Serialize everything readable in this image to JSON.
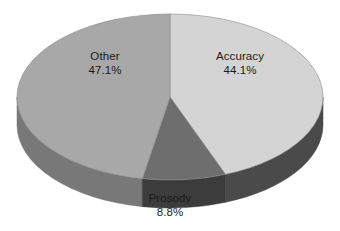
{
  "chart_data": {
    "type": "pie",
    "title": "",
    "subtitle": "",
    "xlabel": "",
    "ylabel": "",
    "grid": false,
    "legend": "none",
    "labels_position": "inside-and-below",
    "three_d": true,
    "background_color": "#ffffff",
    "categories": [
      "Accuracy",
      "Prosody",
      "Other"
    ],
    "values": [
      44.1,
      8.8,
      47.1
    ],
    "unit": "%",
    "slices": [
      {
        "name": "Accuracy",
        "value": 44.1,
        "value_text": "44.1%",
        "color": "#d4d4d4",
        "side_color": "#4a4a4a",
        "start_angle_deg": 0,
        "end_angle_deg": 158.76
      },
      {
        "name": "Prosody",
        "value": 8.8,
        "value_text": "8.8%",
        "color": "#6e6e6e",
        "side_color": "#3c3c3c",
        "start_angle_deg": 158.76,
        "end_angle_deg": 190.44
      },
      {
        "name": "Other",
        "value": 47.1,
        "value_text": "47.1%",
        "color": "#a8a8a8",
        "side_color": "#787878",
        "start_angle_deg": 190.44,
        "end_angle_deg": 360
      }
    ]
  },
  "labels": {
    "accuracy": {
      "name": "Accuracy",
      "percent": "44.1%"
    },
    "prosody": {
      "name": "Prosody",
      "percent": "8.8%"
    },
    "other": {
      "name": "Other",
      "percent": "47.1%"
    }
  },
  "geometry": {
    "center_x": 170,
    "center_y": 97,
    "radius_x": 153,
    "radius_y": 83,
    "depth": 28
  },
  "colors": {
    "accuracy_top": "#d4d4d4",
    "accuracy_side": "#4a4a4a",
    "prosody_top": "#6e6e6e",
    "prosody_side": "#3c3c3c",
    "other_top": "#a8a8a8",
    "other_side": "#787878",
    "outline": "#8c8c8c",
    "text": "#1a1a1a",
    "background": "#ffffff"
  }
}
